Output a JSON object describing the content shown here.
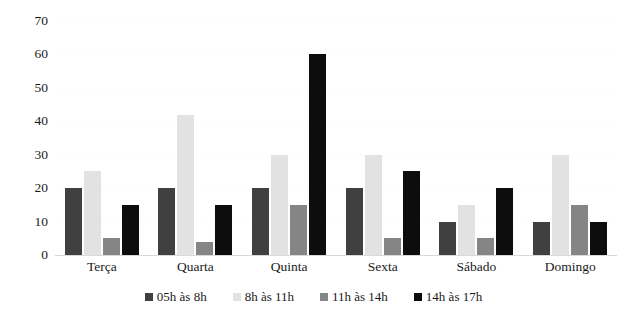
{
  "chart_data": {
    "type": "bar",
    "title": "",
    "xlabel": "",
    "ylabel": "",
    "ylim": [
      0,
      70
    ],
    "yticks": [
      0,
      10,
      20,
      30,
      40,
      50,
      60,
      70
    ],
    "grid": false,
    "legend_position": "bottom",
    "categories": [
      "Terça",
      "Quarta",
      "Quinta",
      "Sexta",
      "Sábado",
      "Domingo"
    ],
    "series": [
      {
        "name": "05h às 8h",
        "color": "#404040",
        "values": [
          20,
          20,
          20,
          20,
          10,
          10
        ]
      },
      {
        "name": "8h às 11h",
        "color": "#e2e2e2",
        "values": [
          25,
          42,
          30,
          30,
          15,
          30
        ]
      },
      {
        "name": "11h às 14h",
        "color": "#858585",
        "values": [
          5,
          4,
          15,
          5,
          5,
          15
        ]
      },
      {
        "name": "14h às 17h",
        "color": "#0d0d0d",
        "values": [
          15,
          15,
          60,
          25,
          20,
          10
        ]
      }
    ]
  }
}
